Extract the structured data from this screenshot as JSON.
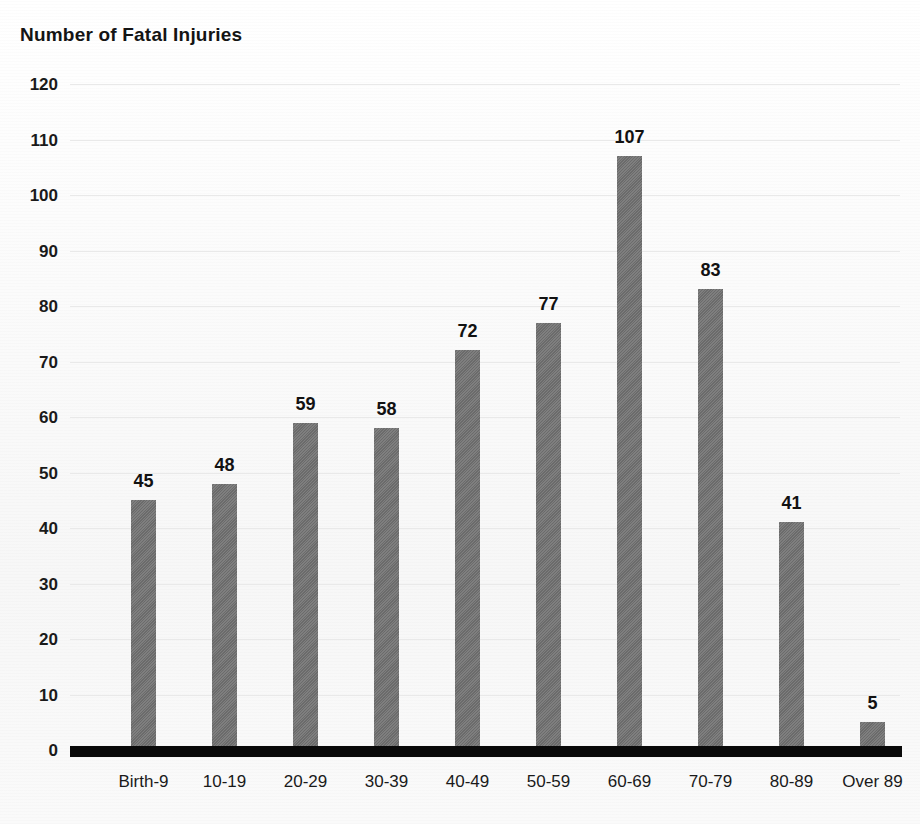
{
  "chart_data": {
    "type": "bar",
    "title": "Number of Fatal Injuries",
    "xlabel": "",
    "ylabel": "",
    "ylim": [
      0,
      120
    ],
    "y_tick_step": 10,
    "grid": true,
    "legend": "none",
    "bar_color": "#717171",
    "axis_color": "#0a0a0a",
    "categories": [
      "Birth-9",
      "10-19",
      "20-29",
      "30-39",
      "40-49",
      "50-59",
      "60-69",
      "70-79",
      "80-89",
      "Over 89"
    ],
    "values": [
      45,
      48,
      59,
      58,
      72,
      77,
      107,
      83,
      41,
      5
    ],
    "value_labels": [
      "45",
      "48",
      "59",
      "58",
      "72",
      "77",
      "107",
      "83",
      "41",
      "5"
    ],
    "y_tick_labels": [
      "120",
      "110",
      "100",
      "90",
      "80",
      "70",
      "60",
      "50",
      "40",
      "30",
      "20",
      "10",
      "0"
    ],
    "y_tick_values": [
      120,
      110,
      100,
      90,
      80,
      70,
      60,
      50,
      40,
      30,
      20,
      10,
      0
    ]
  }
}
